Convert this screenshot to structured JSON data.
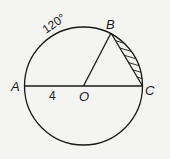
{
  "diagram": {
    "type": "geometry-circle",
    "colors": {
      "background": "#f4f4f2",
      "stroke": "#1a1a1a"
    },
    "circle": {
      "center_label": "O",
      "cx": 83.5,
      "cy": 86,
      "r": 59
    },
    "points": {
      "A": {
        "label": "A",
        "x": 24.5,
        "y": 86
      },
      "B": {
        "label": "B",
        "x": 111,
        "y": 33
      },
      "C": {
        "label": "C",
        "x": 142.5,
        "y": 86
      },
      "O": {
        "label": "O",
        "x": 83.5,
        "y": 86
      }
    },
    "segments": [
      "AC (diameter)",
      "OB",
      "BC"
    ],
    "annotations": {
      "arc_AB": "120°",
      "segment_AO": "4"
    },
    "shaded_region": "circular segment between chord BC and arc BC"
  }
}
